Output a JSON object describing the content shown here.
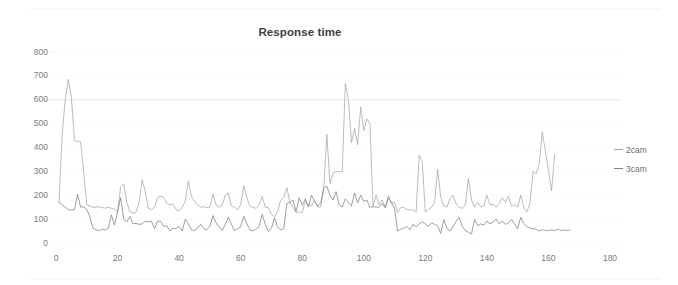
{
  "chart_data": {
    "type": "line",
    "title": "Response time",
    "xlabel": "",
    "ylabel": "",
    "xlim": [
      0,
      185
    ],
    "ylim": [
      0,
      800
    ],
    "xticks": [
      0,
      20,
      40,
      60,
      80,
      100,
      120,
      140,
      160,
      180
    ],
    "yticks": [
      0,
      100,
      200,
      300,
      400,
      500,
      600,
      700,
      800
    ],
    "grid": "horizontal-faint",
    "legend_position": "right",
    "colors": {
      "2cam": "#a6a6a6",
      "3cam": "#808080",
      "grid": "#ededed",
      "axis": "#d9d9d9",
      "text": "#7a7a7a",
      "title": "#3f3f3f"
    },
    "series": [
      {
        "name": "2cam",
        "color": "#a6a6a6",
        "x_start": 1,
        "values": [
          170,
          455,
          600,
          685,
          610,
          430,
          425,
          424,
          300,
          160,
          155,
          150,
          150,
          152,
          148,
          146,
          150,
          145,
          142,
          130,
          235,
          248,
          170,
          130,
          125,
          128,
          170,
          265,
          215,
          145,
          140,
          150,
          190,
          196,
          192,
          165,
          160,
          163,
          140,
          135,
          150,
          175,
          260,
          195,
          175,
          160,
          150,
          152,
          148,
          150,
          205,
          160,
          150,
          158,
          200,
          210,
          155,
          150,
          140,
          160,
          240,
          190,
          155,
          150,
          145,
          160,
          195,
          150,
          148,
          120,
          110,
          130,
          180,
          190,
          232,
          170,
          150,
          128,
          130,
          128,
          175,
          160,
          155,
          178,
          150,
          152,
          230,
          455,
          250,
          290,
          300,
          298,
          300,
          668,
          600,
          420,
          480,
          412,
          570,
          470,
          520,
          500,
          155,
          200,
          160,
          180,
          148,
          198,
          168,
          170,
          128,
          148,
          150,
          140,
          138,
          140,
          130,
          368,
          338,
          130,
          140,
          150,
          170,
          308,
          192,
          155,
          150,
          185,
          200,
          165,
          150,
          145,
          160,
          270,
          180,
          150,
          170,
          150,
          155,
          200,
          160,
          162,
          150,
          165,
          190,
          170,
          195,
          155,
          160,
          150,
          200,
          148,
          130,
          168,
          300,
          290,
          330,
          465,
          385,
          305,
          218,
          368
        ]
      },
      {
        "name": "3cam",
        "color": "#808080",
        "x_start": 1,
        "values": [
          170,
          160,
          150,
          140,
          138,
          140,
          205,
          150,
          152,
          140,
          110,
          62,
          55,
          52,
          58,
          55,
          62,
          118,
          75,
          130,
          190,
          100,
          88,
          112,
          80,
          82,
          78,
          80,
          92,
          88,
          92,
          60,
          92,
          90,
          70,
          72,
          50,
          62,
          60,
          70,
          50,
          100,
          80,
          55,
          52,
          62,
          78,
          60,
          55,
          70,
          115,
          85,
          68,
          52,
          78,
          108,
          78,
          52,
          60,
          68,
          112,
          80,
          55,
          50,
          58,
          70,
          120,
          78,
          48,
          62,
          105,
          68,
          55,
          60,
          165,
          170,
          180,
          132,
          190,
          158,
          185,
          150,
          200,
          175,
          155,
          168,
          230,
          238,
          200,
          180,
          215,
          160,
          150,
          185,
          170,
          155,
          210,
          168,
          200,
          175,
          180,
          150,
          152,
          150,
          150,
          165,
          148,
          190,
          168,
          145,
          50,
          58,
          62,
          70,
          55,
          78,
          68,
          80,
          88,
          80,
          70,
          85,
          78,
          72,
          40,
          98,
          62,
          50,
          68,
          90,
          108,
          70,
          52,
          45,
          38,
          98,
          72,
          80,
          75,
          92,
          80,
          88,
          100,
          80,
          92,
          78,
          85,
          98,
          80,
          60,
          108,
          82,
          68,
          62,
          60,
          58,
          50,
          55,
          52,
          52,
          55,
          52,
          58,
          52,
          55,
          52,
          55
        ]
      }
    ]
  },
  "legend": {
    "items": [
      {
        "label": "2cam"
      },
      {
        "label": "3cam"
      }
    ]
  }
}
